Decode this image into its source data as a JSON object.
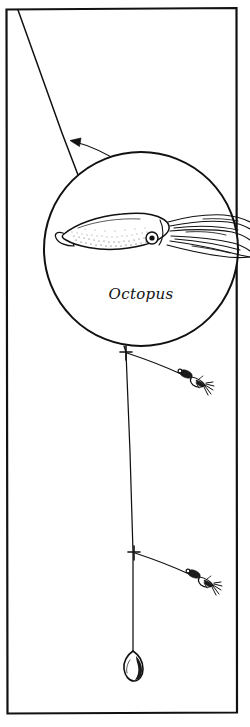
{
  "figure": {
    "style": "black-and-white line drawing",
    "background_color": "#ffffff",
    "ink_color": "#111111",
    "width_px": 250,
    "height_px": 727
  },
  "frame": {
    "name": "illustration-border",
    "shape": "rectangle",
    "x": 6,
    "y": 8,
    "width": 231,
    "height": 706,
    "stroke_color": "#111111"
  },
  "magnifier": {
    "name": "detail-circle",
    "center_x": 141,
    "center_y": 249,
    "radius": 97,
    "caption": "Octopus",
    "caption_x": 141,
    "caption_y": 298,
    "pointer_label": "leader-callout-arrow",
    "pointer_from_x": 128,
    "pointer_from_y": 166,
    "pointer_to_x": 70,
    "pointer_to_y": 141
  },
  "specimen": {
    "name": "octopus-squid-illustration",
    "common_name": "Octopus",
    "parts": [
      {
        "name": "mantle",
        "label": "mantle-body"
      },
      {
        "name": "fin",
        "label": "tail-fin"
      },
      {
        "name": "eye",
        "label": "eye"
      },
      {
        "name": "tentacles",
        "label": "tentacle-arms",
        "count": 8
      }
    ]
  },
  "rig": {
    "name": "squid-jig-dropper-rig",
    "main_line": {
      "name": "main-fishing-line",
      "from_x": 18,
      "from_y": 10,
      "to_x": 133,
      "to_y": 651
    },
    "droppers": [
      {
        "name": "dropper-loop-upper",
        "knot_x": 126,
        "knot_y": 352,
        "lure_x": 196,
        "lure_y": 378,
        "lure_type": "squid-jig"
      },
      {
        "name": "dropper-loop-lower",
        "knot_x": 134,
        "knot_y": 552,
        "lure_x": 203,
        "lure_y": 578,
        "lure_type": "squid-jig"
      }
    ],
    "sinker": {
      "name": "teardrop-sinker",
      "x": 133,
      "y": 663,
      "shape": "teardrop"
    }
  }
}
